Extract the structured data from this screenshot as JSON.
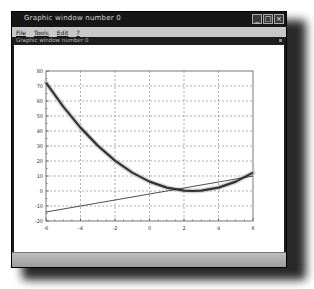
{
  "window": {
    "title": "Graphic window number 0",
    "subtitle": "Graphic window number 0",
    "controls": [
      {
        "name": "minimize",
        "glyph": "_"
      },
      {
        "name": "maximize",
        "glyph": "□"
      },
      {
        "name": "close",
        "glyph": "×"
      }
    ]
  },
  "menu": {
    "items": [
      {
        "label": "File"
      },
      {
        "label": "Tools"
      },
      {
        "label": "Edit"
      },
      {
        "label": "?"
      }
    ]
  },
  "chart_data": {
    "type": "line",
    "title": "",
    "xlabel": "",
    "ylabel": "",
    "xlim": [
      -6,
      6
    ],
    "ylim": [
      -20,
      80
    ],
    "grid": true,
    "x_ticks": [
      -6,
      -4,
      -2,
      0,
      2,
      4,
      6
    ],
    "y_ticks": [
      -20,
      -10,
      0,
      10,
      20,
      30,
      40,
      50,
      60,
      70,
      80
    ],
    "series": [
      {
        "name": "parabola",
        "style": "thick",
        "color": "#333333",
        "x": [
          -6,
          -5,
          -4,
          -3,
          -2,
          -1,
          0,
          1,
          2,
          2.5,
          3,
          4,
          5,
          6
        ],
        "y": [
          72.25,
          56.25,
          42.25,
          30.25,
          20.25,
          12.25,
          6.25,
          2.25,
          0.25,
          0,
          0.25,
          2.25,
          6.25,
          12.25
        ]
      },
      {
        "name": "line",
        "style": "thin",
        "color": "#222222",
        "x": [
          -6,
          6
        ],
        "y": [
          -14,
          10
        ]
      }
    ]
  }
}
